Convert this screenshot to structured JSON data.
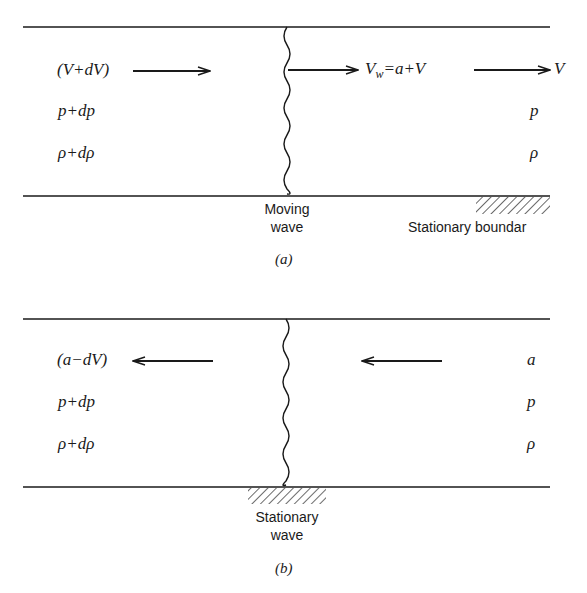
{
  "panel_a": {
    "caption": "(a)",
    "left": {
      "velocity": "(V+dV)",
      "pressure": "p+dp",
      "density": "ρ+dρ"
    },
    "wave_velocity": {
      "symbol": "V",
      "subscript": "w",
      "rest": "=a+V"
    },
    "right": {
      "velocity": "V",
      "pressure": "p",
      "density": "ρ"
    },
    "wave_label": [
      "Moving",
      "wave"
    ],
    "boundary_label": "Stationary boundar"
  },
  "panel_b": {
    "caption": "(b)",
    "left": {
      "velocity": "(a−dV)",
      "pressure": "p+dp",
      "density": "ρ+dρ"
    },
    "right": {
      "velocity": "a",
      "pressure": "p",
      "density": "ρ"
    },
    "wave_label": [
      "Stationary",
      "wave"
    ]
  },
  "colors": {
    "ink": "#1a1a1a",
    "background": "#ffffff"
  }
}
